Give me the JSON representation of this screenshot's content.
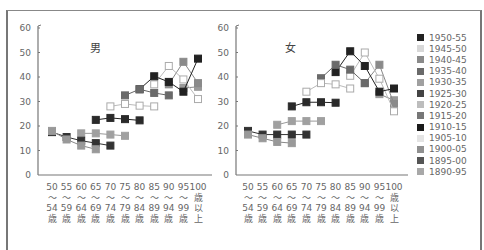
{
  "chart_data": [
    {
      "type": "line",
      "title": "男",
      "xlabel": "",
      "ylabel": "",
      "ylim": [
        0,
        60
      ],
      "yticks": [
        0,
        10,
        20,
        30,
        40,
        50,
        60
      ],
      "grid": false,
      "categories": [
        "50～54歳",
        "55～59歳",
        "60～64歳",
        "65～69歳",
        "70～74歳",
        "75～79歳",
        "80～84歳",
        "85～89歳",
        "90～94歳",
        "95～99歳",
        "100歳以上"
      ],
      "series": [
        {
          "name": "1890-95",
          "start": 9,
          "values": [
            35.5,
            36
          ]
        },
        {
          "name": "1895-00",
          "start": 8,
          "values": [
            37,
            46.2,
            37.5
          ]
        },
        {
          "name": "1900-05",
          "start": 7,
          "values": [
            37,
            44.5,
            39,
            31
          ]
        },
        {
          "name": "1905-10",
          "start": 6,
          "values": [
            35,
            40.3,
            38,
            34,
            47.5
          ]
        },
        {
          "name": "1910-15",
          "start": 5,
          "values": [
            32.5,
            35,
            33.5,
            32.5
          ]
        },
        {
          "name": "1915-20",
          "start": 4,
          "values": [
            28,
            29,
            28.3,
            28
          ]
        },
        {
          "name": "1920-25",
          "start": 3,
          "values": [
            22.5,
            23.3,
            22.8,
            22.3
          ]
        },
        {
          "name": "1925-30",
          "start": 2,
          "values": [
            17,
            17,
            16.5,
            16
          ]
        },
        {
          "name": "1930-35",
          "start": 0,
          "values": [
            17.5,
            15.5,
            14,
            13,
            12
          ]
        },
        {
          "name": "1935-40",
          "start": 0,
          "values": [
            18,
            14.5,
            12,
            10.5
          ]
        }
      ]
    },
    {
      "type": "line",
      "title": "女",
      "xlabel": "",
      "ylabel": "",
      "ylim": [
        0,
        60
      ],
      "yticks": [
        0,
        10,
        20,
        30,
        40,
        50,
        60
      ],
      "grid": false,
      "categories": [
        "50～54歳",
        "55～59歳",
        "60～64歳",
        "65～69歳",
        "70～74歳",
        "75～79歳",
        "80～84歳",
        "85～89歳",
        "90～94歳",
        "95～99歳",
        "100歳以上"
      ],
      "series": [
        {
          "name": "1890-95",
          "start": 9,
          "values": [
            33,
            30.5
          ]
        },
        {
          "name": "1895-00",
          "start": 8,
          "values": [
            37.5,
            45,
            29
          ]
        },
        {
          "name": "1900-05",
          "start": 7,
          "values": [
            40.5,
            50,
            39.3,
            26
          ]
        },
        {
          "name": "1905-10",
          "start": 6,
          "values": [
            42,
            50.5,
            44.5,
            34,
            35.3
          ]
        },
        {
          "name": "1910-15",
          "start": 5,
          "values": [
            39.5,
            45,
            43,
            37.5
          ]
        },
        {
          "name": "1915-20",
          "start": 4,
          "values": [
            34,
            37.5,
            37,
            35.3
          ]
        },
        {
          "name": "1920-25",
          "start": 3,
          "values": [
            28,
            29.7,
            29.7,
            29.5
          ]
        },
        {
          "name": "1925-30",
          "start": 2,
          "values": [
            20.5,
            22,
            22,
            22
          ]
        },
        {
          "name": "1930-35",
          "start": 0,
          "values": [
            18,
            16.5,
            16.5,
            16.5,
            16.5
          ]
        },
        {
          "name": "1935-40",
          "start": 0,
          "values": [
            16.5,
            15,
            13.5,
            13
          ]
        }
      ]
    }
  ],
  "charts": {
    "left": {
      "title": "男"
    },
    "right": {
      "title": "女"
    }
  },
  "x_labels": [
    {
      "top": "50",
      "mid": "～",
      "bot": "54",
      "end": "歳"
    },
    {
      "top": "55",
      "mid": "～",
      "bot": "59",
      "end": "歳"
    },
    {
      "top": "60",
      "mid": "～",
      "bot": "64",
      "end": "歳"
    },
    {
      "top": "65",
      "mid": "～",
      "bot": "69",
      "end": "歳"
    },
    {
      "top": "70",
      "mid": "～",
      "bot": "74",
      "end": "歳"
    },
    {
      "top": "75",
      "mid": "～",
      "bot": "79",
      "end": "歳"
    },
    {
      "top": "80",
      "mid": "～",
      "bot": "84",
      "end": "歳"
    },
    {
      "top": "85",
      "mid": "～",
      "bot": "89",
      "end": "歳"
    },
    {
      "top": "90",
      "mid": "～",
      "bot": "94",
      "end": "歳"
    },
    {
      "top": "95",
      "mid": "～",
      "bot": "99",
      "end": "歳"
    },
    {
      "top": "100",
      "mid": "歳",
      "bot": "以",
      "end": "上"
    }
  ],
  "legend": [
    {
      "label": "1950-55",
      "color": "#222222",
      "fill": true
    },
    {
      "label": "1945-50",
      "color": "#d8d8d8",
      "fill": true
    },
    {
      "label": "1940-45",
      "color": "#8a8a8a",
      "fill": true
    },
    {
      "label": "1935-40",
      "color": "#6a6a6a",
      "fill": true
    },
    {
      "label": "1930-35",
      "color": "#a0a0a0",
      "fill": true
    },
    {
      "label": "1925-30",
      "color": "#444444",
      "fill": true
    },
    {
      "label": "1920-25",
      "color": "#bdbdbd",
      "fill": true
    },
    {
      "label": "1915-20",
      "color": "#777777",
      "fill": true
    },
    {
      "label": "1910-15",
      "color": "#1a1a1a",
      "fill": true
    },
    {
      "label": "1905-10",
      "color": "#e4e4e4",
      "fill": true
    },
    {
      "label": "1900-05",
      "color": "#909090",
      "fill": true
    },
    {
      "label": "1895-00",
      "color": "#555555",
      "fill": true
    },
    {
      "label": "1890-95",
      "color": "#a8a8a8",
      "fill": true
    }
  ]
}
